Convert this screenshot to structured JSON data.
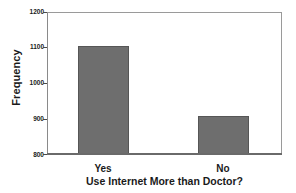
{
  "chart_data": {
    "type": "bar",
    "title": "",
    "xlabel": "Use Internet More than Doctor?",
    "ylabel": "Frequency",
    "categories": [
      "Yes",
      "No"
    ],
    "values": [
      1103,
      906
    ],
    "ylim": [
      800,
      1200
    ],
    "yticks": [
      800,
      900,
      1000,
      1100,
      1200
    ],
    "ytick_labels": [
      "800",
      "900",
      "1000",
      "1100",
      "1200"
    ],
    "grid": false,
    "legend": null,
    "bar_color": "#6e6e6e",
    "bar_edge_color": "#565656",
    "axis_color": "#8a8a8a",
    "text_color": "#1a1a1a",
    "background": "#ffffff"
  }
}
